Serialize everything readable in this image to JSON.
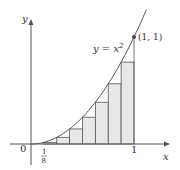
{
  "chart_data": {
    "type": "area",
    "title": "",
    "curve_label": "y = x²",
    "point_label": "(1, 1)",
    "xlabel": "x",
    "ylabel": "y",
    "x_ticks": [
      "0",
      "1/8",
      "1"
    ],
    "n_rectangles": 8,
    "rectangle_width": 0.125,
    "rectangles": [
      {
        "x": 0.0,
        "height": 0.0
      },
      {
        "x": 0.125,
        "height": 0.015625
      },
      {
        "x": 0.25,
        "height": 0.0625
      },
      {
        "x": 0.375,
        "height": 0.140625
      },
      {
        "x": 0.5,
        "height": 0.25
      },
      {
        "x": 0.625,
        "height": 0.390625
      },
      {
        "x": 0.75,
        "height": 0.5625
      },
      {
        "x": 0.875,
        "height": 0.765625
      }
    ],
    "xlim": [
      0,
      1.1
    ],
    "ylim": [
      0,
      1.2
    ],
    "grid": false,
    "colors": {
      "rect_fill": "#e8e8e8",
      "stroke": "#555555",
      "axis": "#555555"
    }
  },
  "labels": {
    "y_axis": "y",
    "x_axis": "x",
    "origin": "0",
    "tick_one": "1",
    "tick_eighth_num": "1",
    "tick_eighth_den": "8",
    "curve": "y = x",
    "curve_exp": "2",
    "point": "(1, 1)"
  }
}
